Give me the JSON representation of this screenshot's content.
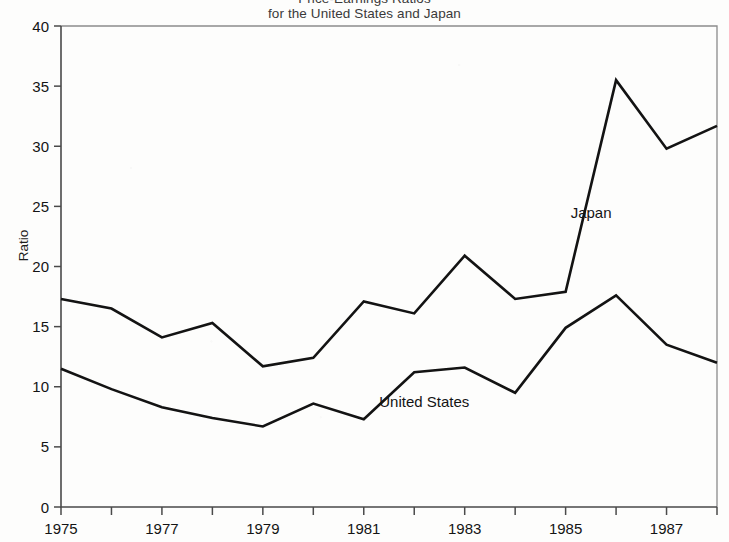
{
  "chart_data": {
    "type": "line",
    "title": "Price-Earnings Ratios\nfor the United States and Japan",
    "title_line1": "Price-Earnings Ratios",
    "title_line2": "for the United States and Japan",
    "xlabel": "",
    "ylabel": "Ratio",
    "xlim": [
      1975,
      1988
    ],
    "ylim": [
      0,
      40
    ],
    "grid": false,
    "legend_position": "inline-annotation",
    "x": [
      1975,
      1976,
      1977,
      1978,
      1979,
      1980,
      1981,
      1982,
      1983,
      1984,
      1985,
      1986,
      1987,
      1988
    ],
    "y_ticks": [
      0,
      5,
      10,
      15,
      20,
      25,
      30,
      35,
      40
    ],
    "y_tick_labels": [
      "0",
      "5",
      "10",
      "15",
      "20",
      "25",
      "30",
      "35",
      "40"
    ],
    "x_ticks": [
      1975,
      1976,
      1977,
      1978,
      1979,
      1980,
      1981,
      1982,
      1983,
      1984,
      1985,
      1986,
      1987,
      1988
    ],
    "x_tick_labels": [
      "1975",
      "",
      "1977",
      "",
      "1979",
      "",
      "1981",
      "",
      "1983",
      "",
      "1985",
      "",
      "1987",
      ""
    ],
    "x_tick_labels_shown": [
      "1975",
      "1977",
      "1979",
      "1981",
      "1983",
      "1985",
      "1987"
    ],
    "series": [
      {
        "name": "Japan",
        "label": "Japan",
        "color": "#131313",
        "values": [
          17.3,
          16.5,
          14.1,
          15.3,
          11.7,
          12.4,
          17.1,
          16.1,
          20.9,
          17.3,
          17.9,
          35.5,
          29.8,
          31.7
        ],
        "annotation": {
          "text": "Japan",
          "x": 1985.1,
          "y": 24.0
        }
      },
      {
        "name": "United States",
        "label": "United States",
        "color": "#131313",
        "values": [
          11.5,
          9.8,
          8.3,
          7.4,
          6.7,
          8.6,
          7.3,
          11.2,
          11.6,
          9.5,
          14.9,
          17.6,
          13.5,
          12.0
        ],
        "annotation": {
          "text": "United States",
          "x": 1982.2,
          "y": 8.3
        }
      }
    ],
    "annotations": [
      {
        "text": "Japan",
        "x": 1985.1,
        "y": 24.0
      },
      {
        "text": "United States",
        "x": 1982.2,
        "y": 8.3
      }
    ]
  }
}
